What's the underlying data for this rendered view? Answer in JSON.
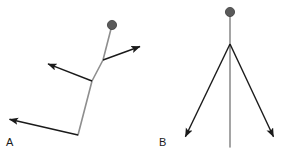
{
  "figure": {
    "background_color": "#ffffff",
    "width": 292,
    "height": 158
  },
  "style": {
    "stem_color": "#8e8e8e",
    "branch_color": "#1a1a1a",
    "node_fill": "#5a5a5a",
    "node_stroke": "#3d3d3d",
    "label_color": "#1a1a1a",
    "stem_width": 1.6,
    "branch_width": 1.4
  },
  "panels": [
    {
      "id": "panel-a",
      "label": "A",
      "label_x": 6,
      "label_y": 146,
      "node": {
        "cx": 112,
        "cy": 25,
        "r": 4.6
      },
      "stem": {
        "name": "main-stem",
        "points": "112,25 103,60 92,81 78,135"
      },
      "branches": [
        {
          "name": "branch-upper-right",
          "direction": "up-right",
          "x1": 103,
          "y1": 60,
          "x2": 144,
          "y2": 45,
          "arrow": true
        },
        {
          "name": "branch-upper-left",
          "direction": "up-left",
          "x1": 92,
          "y1": 81,
          "x2": 43,
          "y2": 62,
          "arrow": true
        },
        {
          "name": "branch-lower-left",
          "direction": "left",
          "x1": 78,
          "y1": 135,
          "x2": 4,
          "y2": 118,
          "arrow": true
        }
      ]
    },
    {
      "id": "panel-b",
      "label": "B",
      "label_x": 159,
      "label_y": 146,
      "node": {
        "cx": 230,
        "cy": 12,
        "r": 4.6
      },
      "stem": {
        "name": "main-stem",
        "points": "230,12 230,44 230,147"
      },
      "branch_origin": {
        "x": 230,
        "y": 44
      },
      "branches": [
        {
          "name": "branch-lower-left",
          "direction": "down-left",
          "x1": 230,
          "y1": 44,
          "x2": 182,
          "y2": 144,
          "arrow": true
        },
        {
          "name": "branch-lower-right",
          "direction": "down-right",
          "x1": 230,
          "y1": 44,
          "x2": 277,
          "y2": 144,
          "arrow": true
        }
      ]
    }
  ]
}
